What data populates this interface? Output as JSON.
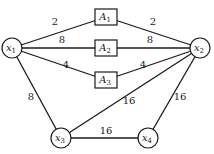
{
  "diagram": {
    "type": "network-graph",
    "nodes": [
      {
        "id": "x1",
        "label": "x",
        "sub": "1",
        "shape": "circle",
        "x": 12,
        "y": 48
      },
      {
        "id": "x2",
        "label": "x",
        "sub": "2",
        "shape": "circle",
        "x": 200,
        "y": 48
      },
      {
        "id": "x3",
        "label": "x",
        "sub": "3",
        "shape": "circle",
        "x": 61,
        "y": 138
      },
      {
        "id": "x4",
        "label": "x",
        "sub": "4",
        "shape": "circle",
        "x": 148,
        "y": 138
      },
      {
        "id": "A1",
        "label": "A",
        "sub": "1",
        "shape": "box",
        "x": 106,
        "y": 17
      },
      {
        "id": "A2",
        "label": "A",
        "sub": "2",
        "shape": "box",
        "x": 106,
        "y": 48
      },
      {
        "id": "A3",
        "label": "A",
        "sub": "3",
        "shape": "box",
        "x": 106,
        "y": 80
      }
    ],
    "edges": [
      {
        "from": "x1",
        "to": "A1",
        "weight": "2",
        "lx": 55,
        "ly": 25
      },
      {
        "from": "A1",
        "to": "x2",
        "weight": "2",
        "lx": 153,
        "ly": 25
      },
      {
        "from": "x1",
        "to": "A2",
        "weight": "8",
        "lx": 62,
        "ly": 43
      },
      {
        "from": "A2",
        "to": "x2",
        "weight": "8",
        "lx": 150,
        "ly": 43
      },
      {
        "from": "x1",
        "to": "A3",
        "weight": "4",
        "lx": 66,
        "ly": 68
      },
      {
        "from": "A3",
        "to": "x2",
        "weight": "4",
        "lx": 143,
        "ly": 68
      },
      {
        "from": "x1",
        "to": "x3",
        "weight": "8",
        "lx": 31,
        "ly": 100
      },
      {
        "from": "x3",
        "to": "x2",
        "weight": "16",
        "lx": 129,
        "ly": 104
      },
      {
        "from": "x3",
        "to": "x4",
        "weight": "16",
        "lx": 106,
        "ly": 134
      },
      {
        "from": "x4",
        "to": "x2",
        "weight": "16",
        "lx": 180,
        "ly": 100
      }
    ]
  }
}
